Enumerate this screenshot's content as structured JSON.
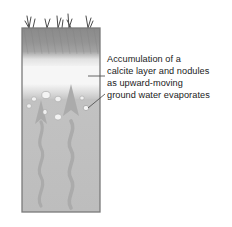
{
  "figure": {
    "type": "soil-profile-diagram",
    "background_color": "#ffffff"
  },
  "annotation": {
    "lines": [
      "Accumulation of a",
      "calcite layer and nodules",
      "as upward-moving",
      "ground water evaporates"
    ],
    "text_color": "#1b1b1b",
    "leader_line_color": "#555555"
  },
  "soil_block": {
    "border_color": "#7a7a7a",
    "layers": [
      {
        "name": "topsoil-dark-horizon",
        "label": "",
        "color_top": "#8d8d8d",
        "color_bottom": "#9c9c9c"
      },
      {
        "name": "calcite-layer-white",
        "label": "",
        "color": "#f4f4f4"
      },
      {
        "name": "subsoil-gray",
        "label": "",
        "color": "#c0c0c0"
      }
    ]
  },
  "features": {
    "grass_tufts": 5,
    "grass_color": "#4a4a4a",
    "nodules": 8,
    "nodule_color": "#f2f2f2",
    "nodule_outline": "#a5a5a5",
    "water_arrows": 2,
    "arrow_color": "#a8a8a8"
  }
}
